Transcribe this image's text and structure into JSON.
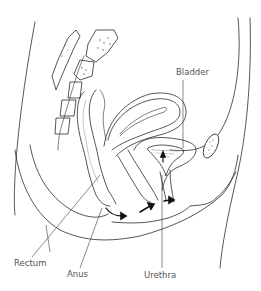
{
  "diagram": {
    "type": "anatomical-line-drawing",
    "view": "sagittal cross-section of pelvis",
    "colors": {
      "line": "#2b2b2b",
      "label_text": "#555555",
      "background": "#ffffff"
    },
    "labels": {
      "bladder": "Bladder",
      "rectum": "Rectum",
      "anus": "Anus",
      "urethra": "Urethra"
    },
    "arrows": [
      {
        "name": "flow-arrow-anal",
        "direction": "right"
      },
      {
        "name": "flow-arrow-vaginal",
        "direction": "up-right"
      },
      {
        "name": "flow-arrow-urethral",
        "direction": "right"
      },
      {
        "name": "flow-arrow-bladder",
        "direction": "up"
      }
    ]
  }
}
